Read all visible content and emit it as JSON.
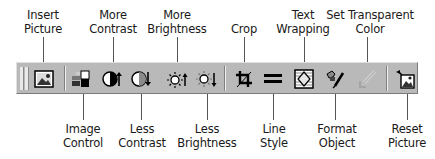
{
  "toolbar": {
    "name": "Picture toolbar",
    "background": "#b9b9b9",
    "buttons": [
      {
        "id": "insert-picture",
        "label": "Insert Picture",
        "icon": "insert-picture-icon"
      },
      {
        "id": "image-control",
        "label": "Image Control",
        "icon": "image-control-icon"
      },
      {
        "id": "more-contrast",
        "label": "More Contrast",
        "icon": "more-contrast-icon"
      },
      {
        "id": "less-contrast",
        "label": "Less Contrast",
        "icon": "less-contrast-icon"
      },
      {
        "id": "more-brightness",
        "label": "More Brightness",
        "icon": "more-brightness-icon"
      },
      {
        "id": "less-brightness",
        "label": "Less Brightness",
        "icon": "less-brightness-icon"
      },
      {
        "id": "crop",
        "label": "Crop",
        "icon": "crop-icon"
      },
      {
        "id": "line-style",
        "label": "Line Style",
        "icon": "line-style-icon"
      },
      {
        "id": "text-wrapping",
        "label": "Text Wrapping",
        "icon": "text-wrapping-icon"
      },
      {
        "id": "format-object",
        "label": "Format Object",
        "icon": "format-object-icon"
      },
      {
        "id": "set-transparent-color",
        "label": "Set Transparent Color",
        "icon": "set-transparent-color-icon"
      },
      {
        "id": "reset-picture",
        "label": "Reset Picture",
        "icon": "reset-picture-icon"
      }
    ]
  },
  "callouts": {
    "top": {
      "insert_picture": [
        "Insert",
        "Picture"
      ],
      "more_contrast": [
        "More",
        "Contrast"
      ],
      "more_brightness": [
        "More",
        "Brightness"
      ],
      "crop": [
        "Crop"
      ],
      "text_wrapping": [
        "Text",
        "Wrapping"
      ],
      "set_transparent_color": [
        "Set Transparent",
        "Color"
      ]
    },
    "bottom": {
      "image_control": [
        "Image",
        "Control"
      ],
      "less_contrast": [
        "Less",
        "Contrast"
      ],
      "less_brightness": [
        "Less",
        "Brightness"
      ],
      "line_style": [
        "Line",
        "Style"
      ],
      "format_object": [
        "Format",
        "Object"
      ],
      "reset_picture": [
        "Reset",
        "Picture"
      ]
    }
  }
}
